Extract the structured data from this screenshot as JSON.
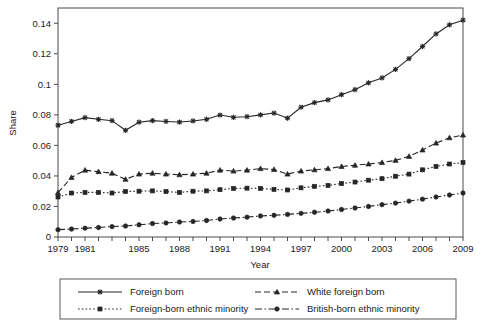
{
  "chart_data": {
    "type": "line",
    "title": "",
    "xlabel": "Year",
    "ylabel": "Share",
    "xlim": [
      1979,
      2009
    ],
    "ylim": [
      0,
      0.15
    ],
    "grid": false,
    "legend_position": "bottom",
    "x": [
      1979,
      1980,
      1981,
      1982,
      1983,
      1984,
      1985,
      1986,
      1987,
      1988,
      1989,
      1990,
      1991,
      1992,
      1993,
      1994,
      1995,
      1996,
      1997,
      1998,
      1999,
      2000,
      2001,
      2002,
      2003,
      2004,
      2005,
      2006,
      2007,
      2008,
      2009
    ],
    "xtick_labels": [
      "1979",
      "1981",
      "1985",
      "1988",
      "1991",
      "1994",
      "1997",
      "2000",
      "2003",
      "2006",
      "2009"
    ],
    "xtick_values": [
      1979,
      1981,
      1985,
      1988,
      1991,
      1994,
      1997,
      2000,
      2003,
      2006,
      2009
    ],
    "ytick_labels": [
      "0",
      "0.02",
      "0.04",
      "0.06",
      "0.08",
      "0.1",
      "0.12",
      "0.14"
    ],
    "ytick_values": [
      0,
      0.02,
      0.04,
      0.06,
      0.08,
      0.1,
      0.12,
      0.14
    ],
    "series": [
      {
        "name": "Foreign born",
        "style": "solid",
        "marker": "star",
        "values": [
          0.0732,
          0.0757,
          0.0782,
          0.0771,
          0.0762,
          0.0699,
          0.0752,
          0.0762,
          0.0757,
          0.0753,
          0.076,
          0.0771,
          0.0799,
          0.0784,
          0.0788,
          0.08,
          0.0812,
          0.0778,
          0.085,
          0.088,
          0.0898,
          0.0932,
          0.0965,
          0.101,
          0.1042,
          0.1098,
          0.1168,
          0.1248,
          0.133,
          0.139,
          0.142
        ]
      },
      {
        "name": "White foreign born",
        "style": "dashed",
        "marker": "triangle",
        "values": [
          0.029,
          0.039,
          0.0438,
          0.0428,
          0.0418,
          0.0378,
          0.0412,
          0.0418,
          0.0412,
          0.0408,
          0.0412,
          0.0418,
          0.0438,
          0.0432,
          0.0438,
          0.0448,
          0.0442,
          0.0412,
          0.0432,
          0.044,
          0.0448,
          0.0462,
          0.047,
          0.0478,
          0.0488,
          0.0502,
          0.0528,
          0.057,
          0.0615,
          0.065,
          0.0668
        ]
      },
      {
        "name": "Foreign-born ethnic minority",
        "style": "dotted",
        "marker": "square",
        "values": [
          0.0262,
          0.0288,
          0.0292,
          0.0292,
          0.0288,
          0.0298,
          0.03,
          0.0302,
          0.0298,
          0.0292,
          0.03,
          0.0302,
          0.031,
          0.0318,
          0.032,
          0.0318,
          0.0312,
          0.0308,
          0.0322,
          0.0332,
          0.0338,
          0.035,
          0.036,
          0.0372,
          0.0382,
          0.0398,
          0.0412,
          0.044,
          0.0462,
          0.0478,
          0.0488
        ]
      },
      {
        "name": "British-born ethnic minority",
        "style": "dashdot",
        "marker": "circle",
        "values": [
          0.0048,
          0.0052,
          0.0058,
          0.0062,
          0.0068,
          0.0072,
          0.008,
          0.0088,
          0.0092,
          0.0098,
          0.0102,
          0.0108,
          0.0118,
          0.0124,
          0.013,
          0.0138,
          0.0142,
          0.0148,
          0.0155,
          0.0162,
          0.017,
          0.018,
          0.019,
          0.02,
          0.0212,
          0.0222,
          0.0235,
          0.0248,
          0.0262,
          0.0275,
          0.0288
        ]
      }
    ]
  },
  "legend": {
    "entries": [
      {
        "label": "Foreign born"
      },
      {
        "label": "White foreign born"
      },
      {
        "label": "Foreign-born ethnic minority"
      },
      {
        "label": "British-born ethnic minority"
      }
    ]
  },
  "colors": {
    "line": "#262626",
    "axis": "#4a4a4a",
    "text": "#1a1a1a",
    "background": "#ffffff"
  }
}
